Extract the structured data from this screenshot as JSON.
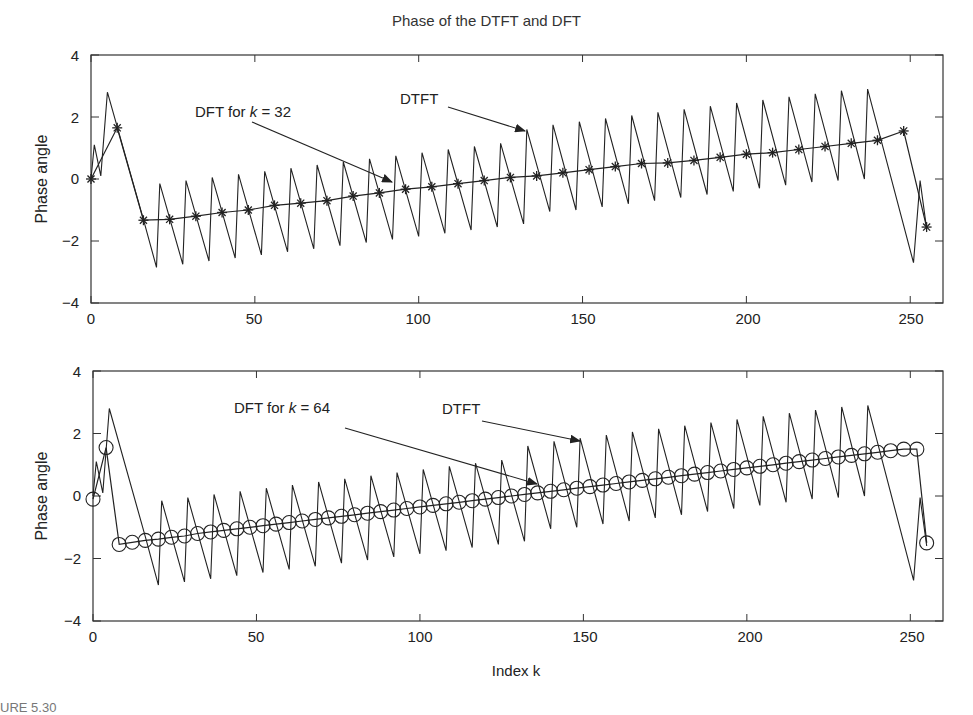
{
  "figure": {
    "title": "Phase of the DTFT and DFT",
    "xlabel": "Index k",
    "caption_fragment": "URE 5.30"
  },
  "chart_data": [
    {
      "type": "line",
      "panel": "top",
      "title": "Phase of the DTFT and DFT",
      "xlabel": "",
      "ylabel": "Phase angle",
      "xlim": [
        0,
        260
      ],
      "ylim": [
        -4,
        4
      ],
      "xticks": [
        0,
        50,
        100,
        150,
        200,
        250
      ],
      "yticks": [
        -4,
        -2,
        0,
        2,
        4
      ],
      "grid": false,
      "series": [
        {
          "name": "DTFT",
          "style": "solid line, sawtooth",
          "description": "Sawtooth of period ~8 indices riding on a linear trend from about -1.4 at k=16 to about +1.5 at k=248; teeth swing roughly +/-1.4 around the trend; wrap at start (peak ~2.8 near k=5) and end (trough ~-2.7 near k=251)",
          "x": [
            0,
            1,
            3,
            5,
            16,
            20,
            21,
            28,
            29,
            36,
            37,
            44,
            45,
            52,
            53,
            60,
            61,
            68,
            69,
            76,
            77,
            84,
            85,
            92,
            93,
            100,
            101,
            108,
            109,
            116,
            117,
            124,
            125,
            132,
            133,
            140,
            141,
            148,
            149,
            156,
            157,
            164,
            165,
            172,
            173,
            180,
            181,
            188,
            189,
            196,
            197,
            204,
            205,
            212,
            213,
            220,
            221,
            228,
            229,
            236,
            237,
            251,
            253,
            255
          ],
          "y": [
            0,
            1.1,
            0.1,
            2.8,
            -1.3,
            -2.85,
            -0.15,
            -2.75,
            -0.05,
            -2.65,
            0.05,
            -2.55,
            0.15,
            -2.45,
            0.25,
            -2.35,
            0.35,
            -2.25,
            0.45,
            -2.15,
            0.55,
            -2.05,
            0.65,
            -1.95,
            0.75,
            -1.85,
            0.85,
            -1.75,
            0.95,
            -1.65,
            1.05,
            -1.55,
            1.15,
            -1.45,
            1.6,
            -1.05,
            1.75,
            -1.0,
            1.85,
            -0.9,
            1.95,
            -0.8,
            2.05,
            -0.7,
            2.15,
            -0.6,
            2.25,
            -0.5,
            2.35,
            -0.4,
            2.45,
            -0.3,
            2.55,
            -0.2,
            2.65,
            -0.1,
            2.75,
            -0.05,
            2.85,
            0.0,
            2.9,
            -2.7,
            -0.05,
            -1.6
          ]
        },
        {
          "name": "DFT for k = 32",
          "style": "asterisk markers joined by line",
          "x": [
            0,
            8,
            16,
            24,
            32,
            40,
            48,
            56,
            64,
            72,
            80,
            88,
            96,
            104,
            112,
            120,
            128,
            136,
            144,
            152,
            160,
            168,
            176,
            184,
            192,
            200,
            208,
            216,
            224,
            232,
            240,
            248,
            255
          ],
          "y": [
            0,
            1.65,
            -1.33,
            -1.3,
            -1.2,
            -1.08,
            -1.0,
            -0.85,
            -0.78,
            -0.7,
            -0.55,
            -0.45,
            -0.33,
            -0.25,
            -0.15,
            -0.05,
            0.05,
            0.1,
            0.2,
            0.3,
            0.4,
            0.5,
            0.52,
            0.6,
            0.7,
            0.8,
            0.85,
            0.95,
            1.05,
            1.15,
            1.25,
            1.55,
            -1.55
          ]
        }
      ],
      "annotations": [
        {
          "text": "DFT for k = 32",
          "points_to": "DFT markers near k=91"
        },
        {
          "text": "DTFT",
          "points_to": "DTFT peak near k=132"
        }
      ]
    },
    {
      "type": "line",
      "panel": "bottom",
      "xlabel": "Index k",
      "ylabel": "Phase angle",
      "xlim": [
        0,
        260
      ],
      "ylim": [
        -4,
        4
      ],
      "xticks": [
        0,
        50,
        100,
        150,
        200,
        250
      ],
      "yticks": [
        -4,
        -2,
        0,
        2,
        4
      ],
      "grid": false,
      "series": [
        {
          "name": "DTFT",
          "style": "solid line, sawtooth",
          "description": "Same DTFT phase curve as the top panel",
          "x": [
            0,
            1,
            3,
            5,
            16,
            20,
            21,
            28,
            29,
            36,
            37,
            44,
            45,
            52,
            53,
            60,
            61,
            68,
            69,
            76,
            77,
            84,
            85,
            92,
            93,
            100,
            101,
            108,
            109,
            116,
            117,
            124,
            125,
            132,
            133,
            140,
            141,
            148,
            149,
            156,
            157,
            164,
            165,
            172,
            173,
            180,
            181,
            188,
            189,
            196,
            197,
            204,
            205,
            212,
            213,
            220,
            221,
            228,
            229,
            236,
            237,
            251,
            253,
            255
          ],
          "y": [
            0,
            1.1,
            0.1,
            2.8,
            -1.3,
            -2.85,
            -0.15,
            -2.75,
            -0.05,
            -2.65,
            0.05,
            -2.55,
            0.15,
            -2.45,
            0.25,
            -2.35,
            0.35,
            -2.25,
            0.45,
            -2.15,
            0.55,
            -2.05,
            0.65,
            -1.95,
            0.75,
            -1.85,
            0.85,
            -1.75,
            0.95,
            -1.65,
            1.05,
            -1.55,
            1.15,
            -1.45,
            1.6,
            -1.05,
            1.75,
            -1.0,
            1.85,
            -0.9,
            1.95,
            -0.8,
            2.05,
            -0.7,
            2.15,
            -0.6,
            2.25,
            -0.5,
            2.35,
            -0.4,
            2.45,
            -0.3,
            2.55,
            -0.2,
            2.65,
            -0.1,
            2.75,
            -0.05,
            2.85,
            0.0,
            2.9,
            -2.7,
            -0.05,
            -1.6
          ]
        },
        {
          "name": "DFT for k = 64",
          "style": "circle markers joined by line",
          "x": [
            0,
            4,
            8,
            12,
            16,
            20,
            24,
            28,
            32,
            36,
            40,
            44,
            48,
            52,
            56,
            60,
            64,
            68,
            72,
            76,
            80,
            84,
            88,
            92,
            96,
            100,
            104,
            108,
            112,
            116,
            120,
            124,
            128,
            132,
            136,
            140,
            144,
            148,
            152,
            156,
            160,
            164,
            168,
            172,
            176,
            180,
            184,
            188,
            192,
            196,
            200,
            204,
            208,
            212,
            216,
            220,
            224,
            228,
            232,
            236,
            240,
            244,
            248,
            252,
            255
          ],
          "y": [
            -0.1,
            1.55,
            -1.55,
            -1.48,
            -1.42,
            -1.38,
            -1.32,
            -1.28,
            -1.2,
            -1.15,
            -1.1,
            -1.05,
            -1.0,
            -0.95,
            -0.9,
            -0.85,
            -0.8,
            -0.75,
            -0.7,
            -0.65,
            -0.6,
            -0.55,
            -0.5,
            -0.45,
            -0.4,
            -0.35,
            -0.3,
            -0.25,
            -0.2,
            -0.15,
            -0.1,
            -0.05,
            0.0,
            0.05,
            0.1,
            0.15,
            0.2,
            0.25,
            0.3,
            0.35,
            0.4,
            0.45,
            0.5,
            0.55,
            0.6,
            0.65,
            0.7,
            0.75,
            0.8,
            0.85,
            0.9,
            0.95,
            1.0,
            1.05,
            1.1,
            1.15,
            1.2,
            1.25,
            1.3,
            1.35,
            1.4,
            1.45,
            1.5,
            1.5,
            -1.5
          ]
        }
      ],
      "annotations": [
        {
          "text": "DFT for k = 64",
          "points_to": "DFT markers near k=135"
        },
        {
          "text": "DTFT",
          "points_to": "DTFT peak near k=148"
        }
      ]
    }
  ],
  "panels": [
    {
      "ylabel": "Phase angle",
      "ytick_labels": [
        "4",
        "2",
        "0",
        "−2",
        "−4"
      ],
      "xtick_labels": [
        "0",
        "50",
        "100",
        "150",
        "200",
        "250"
      ],
      "annot_dft_prefix": "DFT for ",
      "annot_dft_k": "k",
      "annot_dft_suffix": " = 32",
      "annot_dtft": "DTFT"
    },
    {
      "ylabel": "Phase angle",
      "ytick_labels": [
        "4",
        "2",
        "0",
        "−2",
        "−4"
      ],
      "xtick_labels": [
        "0",
        "50",
        "100",
        "150",
        "200",
        "250"
      ],
      "annot_dft_prefix": "DFT for ",
      "annot_dft_k": "k",
      "annot_dft_suffix": " = 64",
      "annot_dtft": "DTFT"
    }
  ]
}
